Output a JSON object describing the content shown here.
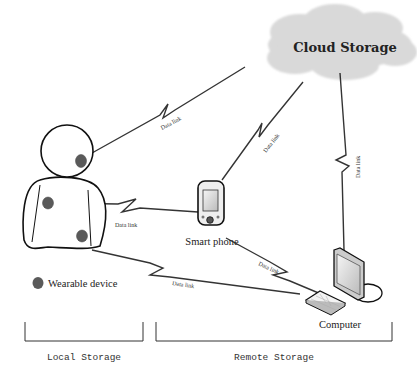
{
  "cloud": {
    "label": "Cloud Storage"
  },
  "devices": {
    "smartphone": {
      "label": "Smart phone"
    },
    "computer": {
      "label": "Computer"
    }
  },
  "legend": {
    "wearable_label": "Wearable device",
    "marker_color": "#5a5a5a"
  },
  "links": {
    "person_cloud": "Data link",
    "phone_cloud": "Data link",
    "computer_cloud": "Data link",
    "person_phone": "Data link",
    "phone_computer": "Data link",
    "person_computer": "Data link"
  },
  "groups": {
    "local": "Local Storage",
    "remote": "Remote Storage"
  },
  "colors": {
    "cloud_fill": "#d9d9d9",
    "line": "#111111",
    "background": "#ffffff"
  }
}
